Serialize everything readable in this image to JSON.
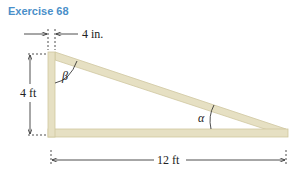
{
  "title": "Exercise 68",
  "diagram": {
    "type": "right-triangle-truss",
    "labels": {
      "top_width": "4 in.",
      "height": "4 ft",
      "base": "12 ft",
      "angle_top": "β",
      "angle_bottom": "α"
    },
    "colors": {
      "title": "#4a8fc9",
      "beam_fill": "#e6e0c3",
      "beam_edge": "#cfc79f",
      "line": "#222222"
    }
  }
}
